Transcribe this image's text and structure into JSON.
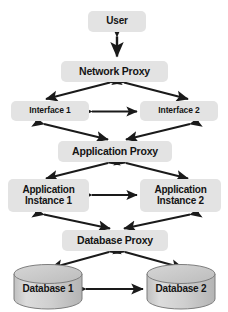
{
  "diagram": {
    "type": "architecture-tier-diagram",
    "background_color": "#ffffff",
    "node_fill_color": "#e3e3e3",
    "cylinder_fill_color": "#c9c9c9",
    "cylinder_top_color": "#d8d8d8",
    "arrow_color": "#1a1a1a",
    "nodes": [
      {
        "id": "user",
        "label": "User",
        "shape": "rounded-rect"
      },
      {
        "id": "network_proxy",
        "label": "Network Proxy",
        "shape": "rounded-rect"
      },
      {
        "id": "interface_1",
        "label": "Interface 1",
        "shape": "rounded-rect"
      },
      {
        "id": "interface_2",
        "label": "Interface 2",
        "shape": "rounded-rect"
      },
      {
        "id": "application_proxy",
        "label": "Application Proxy",
        "shape": "rounded-rect"
      },
      {
        "id": "application_instance_1",
        "label": "Application\nInstance 1",
        "shape": "rounded-rect"
      },
      {
        "id": "application_instance_2",
        "label": "Application\nInstance 2",
        "shape": "rounded-rect"
      },
      {
        "id": "database_proxy",
        "label": "Database Proxy",
        "shape": "rounded-rect"
      },
      {
        "id": "database_1",
        "label": "Database 1",
        "shape": "cylinder"
      },
      {
        "id": "database_2",
        "label": "Database 2",
        "shape": "cylinder"
      }
    ],
    "connections": [
      {
        "from": "user",
        "to": "network_proxy",
        "style": "double-arrow-vertical"
      },
      {
        "from": "network_proxy",
        "to": "interface_1",
        "style": "double-arrow-diagonal"
      },
      {
        "from": "network_proxy",
        "to": "interface_2",
        "style": "double-arrow-diagonal"
      },
      {
        "from": "interface_1",
        "to": "interface_2",
        "style": "double-arrow-horizontal"
      },
      {
        "from": "interface_1",
        "to": "application_proxy",
        "style": "double-arrow-diagonal"
      },
      {
        "from": "interface_2",
        "to": "application_proxy",
        "style": "double-arrow-diagonal"
      },
      {
        "from": "application_proxy",
        "to": "application_instance_1",
        "style": "double-arrow-diagonal"
      },
      {
        "from": "application_proxy",
        "to": "application_instance_2",
        "style": "double-arrow-diagonal"
      },
      {
        "from": "application_instance_1",
        "to": "application_instance_2",
        "style": "double-arrow-horizontal"
      },
      {
        "from": "application_instance_1",
        "to": "database_proxy",
        "style": "double-arrow-diagonal"
      },
      {
        "from": "application_instance_2",
        "to": "database_proxy",
        "style": "double-arrow-diagonal"
      },
      {
        "from": "database_proxy",
        "to": "database_1",
        "style": "double-arrow-diagonal"
      },
      {
        "from": "database_proxy",
        "to": "database_2",
        "style": "double-arrow-diagonal"
      },
      {
        "from": "database_1",
        "to": "database_2",
        "style": "double-arrow-horizontal"
      }
    ]
  }
}
